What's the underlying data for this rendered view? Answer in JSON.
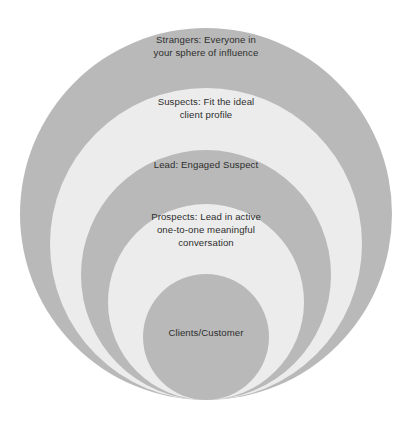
{
  "diagram": {
    "type": "concentric-circles-funnel",
    "orientation": "bottom-aligned-nested",
    "background_color": "#ffffff",
    "text_color": "#2e2e2e",
    "fill_dark": "#b9b9b9",
    "fill_light": "#ececec",
    "canvas": {
      "width": 412,
      "height": 422
    },
    "rings": [
      {
        "index": 0,
        "name": "strangers",
        "label": "Strangers: Everyone in\nyour sphere of influence",
        "fill": "#b9b9b9",
        "tone": "dark",
        "cx": 206,
        "cy": 214,
        "r": 186
      },
      {
        "index": 1,
        "name": "suspects",
        "label": "Suspects: Fit the ideal\nclient profile",
        "fill": "#ececec",
        "tone": "light",
        "cx": 206,
        "cy": 244,
        "r": 156
      },
      {
        "index": 2,
        "name": "lead",
        "label": "Lead: Engaged Suspect",
        "fill": "#b9b9b9",
        "tone": "dark",
        "cx": 206,
        "cy": 275,
        "r": 125
      },
      {
        "index": 3,
        "name": "prospects",
        "label": "Prospects: Lead in active\none-to-one meaningful\nconversation",
        "fill": "#ececec",
        "tone": "light",
        "cx": 206,
        "cy": 302,
        "r": 98
      },
      {
        "index": 4,
        "name": "clients",
        "label": "Clients/Customer",
        "fill": "#b9b9b9",
        "tone": "dark",
        "cx": 206,
        "cy": 337,
        "r": 63
      }
    ]
  }
}
